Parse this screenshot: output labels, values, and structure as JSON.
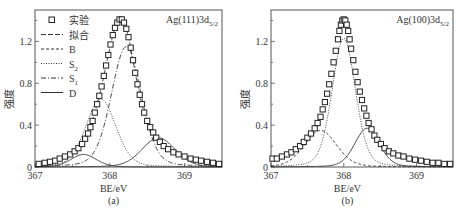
{
  "chart_data": [
    {
      "type": "line",
      "panel_label": "(a)",
      "annotation": "Ag(111)3d",
      "annotation_sub": "5/2",
      "xlabel": "BE/eV",
      "ylabel": "强度",
      "xlim": [
        367,
        369.5
      ],
      "ylim": [
        0,
        1.5
      ],
      "xticks": [
        367,
        368,
        369
      ],
      "xtick_labels": [
        "367",
        "368",
        "369"
      ],
      "yticks": [
        0,
        0.4,
        0.8,
        1.2
      ],
      "ytick_labels": [
        "0",
        "0.4",
        "0.8",
        "1.2"
      ],
      "legend": {
        "placement": "top-left",
        "entries": [
          {
            "label": "实验",
            "style": "square-marker"
          },
          {
            "label": "拟合",
            "style": "long-dash"
          },
          {
            "label": "B",
            "style": "dashed"
          },
          {
            "label": "S",
            "sub": "2",
            "style": "dotted"
          },
          {
            "label": "S",
            "sub": "1",
            "style": "dash-dot"
          },
          {
            "label": "D",
            "style": "solid"
          }
        ]
      },
      "components": [
        {
          "name": "B",
          "style": "solid",
          "center": 367.65,
          "height": 0.12,
          "width": 0.17
        },
        {
          "name": "S2",
          "style": "dotted",
          "center": 367.88,
          "height": 0.65,
          "width": 0.2
        },
        {
          "name": "S1",
          "style": "dash-dot",
          "center": 368.22,
          "height": 1.15,
          "width": 0.2
        },
        {
          "name": "D",
          "style": "solid",
          "center": 368.65,
          "height": 0.28,
          "width": 0.22
        }
      ],
      "experimental": {
        "x": [
          367.05,
          367.13,
          367.2,
          367.27,
          367.33,
          367.4,
          367.47,
          367.53,
          367.58,
          367.63,
          367.67,
          367.71,
          367.74,
          367.77,
          367.8,
          367.83,
          367.86,
          367.89,
          367.92,
          367.95,
          367.98,
          368.01,
          368.04,
          368.07,
          368.1,
          368.13,
          368.16,
          368.19,
          368.22,
          368.25,
          368.28,
          368.31,
          368.34,
          368.37,
          368.4,
          368.43,
          368.46,
          368.5,
          368.54,
          368.58,
          368.62,
          368.67,
          368.72,
          368.78,
          368.85,
          368.92,
          369.0,
          369.08,
          369.15,
          369.22,
          369.3,
          369.38,
          369.46
        ],
        "y": [
          0.03,
          0.04,
          0.05,
          0.06,
          0.08,
          0.1,
          0.12,
          0.15,
          0.18,
          0.22,
          0.27,
          0.32,
          0.38,
          0.44,
          0.52,
          0.6,
          0.68,
          0.77,
          0.87,
          0.97,
          1.07,
          1.17,
          1.26,
          1.33,
          1.38,
          1.41,
          1.41,
          1.38,
          1.32,
          1.24,
          1.14,
          1.02,
          0.9,
          0.79,
          0.69,
          0.6,
          0.52,
          0.44,
          0.38,
          0.33,
          0.28,
          0.24,
          0.2,
          0.17,
          0.14,
          0.12,
          0.1,
          0.08,
          0.07,
          0.06,
          0.05,
          0.04,
          0.03
        ]
      }
    },
    {
      "type": "line",
      "panel_label": "(b)",
      "annotation": "Ag(100)3d",
      "annotation_sub": "5/2",
      "xlabel": "BE/eV",
      "ylabel": "强度",
      "xlim": [
        367,
        369.5
      ],
      "ylim": [
        0,
        1.5
      ],
      "xticks": [
        367,
        368,
        369
      ],
      "xtick_labels": [
        "367",
        "368",
        "369"
      ],
      "yticks": [
        0,
        0.4,
        0.8,
        1.2
      ],
      "ytick_labels": [
        "0",
        "0.4",
        "0.8",
        "1.2"
      ],
      "components": [
        {
          "name": "B",
          "style": "dashed",
          "center": 367.68,
          "height": 0.35,
          "width": 0.22
        },
        {
          "name": "S2",
          "style": "dotted",
          "center": 368.0,
          "height": 1.23,
          "width": 0.16
        },
        {
          "name": "D",
          "style": "solid",
          "center": 368.32,
          "height": 0.37,
          "width": 0.17
        }
      ],
      "experimental": {
        "x": [
          367.02,
          367.08,
          367.15,
          367.22,
          367.28,
          367.34,
          367.4,
          367.45,
          367.5,
          367.55,
          367.6,
          367.64,
          367.68,
          367.71,
          367.74,
          367.77,
          367.8,
          367.83,
          367.86,
          367.89,
          367.92,
          367.94,
          367.96,
          367.98,
          368.0,
          368.02,
          368.04,
          368.06,
          368.08,
          368.1,
          368.13,
          368.16,
          368.19,
          368.22,
          368.25,
          368.28,
          368.31,
          368.34,
          368.38,
          368.42,
          368.46,
          368.51,
          368.56,
          368.62,
          368.68,
          368.75,
          368.82,
          368.9,
          368.98,
          369.06,
          369.14,
          369.22,
          369.3,
          369.38,
          369.46
        ],
        "y": [
          0.08,
          0.08,
          0.1,
          0.12,
          0.14,
          0.17,
          0.2,
          0.24,
          0.28,
          0.32,
          0.37,
          0.42,
          0.48,
          0.55,
          0.62,
          0.7,
          0.79,
          0.89,
          1.0,
          1.11,
          1.22,
          1.3,
          1.36,
          1.4,
          1.41,
          1.4,
          1.36,
          1.3,
          1.22,
          1.13,
          1.02,
          0.91,
          0.81,
          0.72,
          0.64,
          0.56,
          0.49,
          0.42,
          0.36,
          0.3,
          0.26,
          0.22,
          0.18,
          0.15,
          0.13,
          0.11,
          0.1,
          0.08,
          0.07,
          0.06,
          0.05,
          0.04,
          0.04,
          0.03,
          0.03
        ]
      }
    }
  ]
}
